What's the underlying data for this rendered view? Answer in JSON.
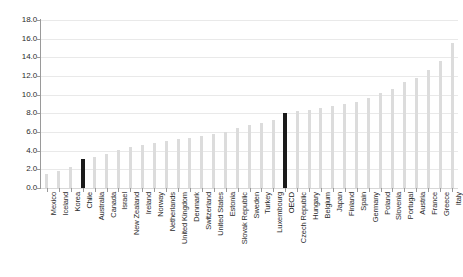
{
  "chart_data": {
    "type": "bar",
    "title": "",
    "subtitle": "",
    "xlabel": "",
    "ylabel": "",
    "ylim": [
      0.0,
      18.0
    ],
    "ytick_labels": [
      "18.0",
      "16.0",
      "14.0",
      "12.0",
      "10.0",
      "8.0",
      "6.0",
      "4.0",
      "2.0",
      "0.0"
    ],
    "ytick_values": [
      18.0,
      16.0,
      14.0,
      12.0,
      10.0,
      8.0,
      6.0,
      4.0,
      2.0,
      0.0
    ],
    "grid": true,
    "legend": "none",
    "bar_color": "#dcdcdc",
    "highlight_color": "#1b1b1b",
    "highlighted": [
      "Chile",
      "OECD"
    ],
    "categories": [
      "Mexico",
      "Iceland",
      "Korea",
      "Chile",
      "Australia",
      "Canada",
      "Israel",
      "New Zealand",
      "Ireland",
      "Norway",
      "Netherlands",
      "United Kingdom",
      "Denmark",
      "Switzerland",
      "United States",
      "Estonia",
      "Slovak Republic",
      "Sweden",
      "Turkey",
      "Luxembourg",
      "OECD",
      "Czech Republic",
      "Hungary",
      "Belgium",
      "Japan",
      "Finland",
      "Spain",
      "Germany",
      "Poland",
      "Slovenia",
      "Portugal",
      "Austria",
      "France",
      "Greece",
      "Italy"
    ],
    "values": [
      1.5,
      1.8,
      2.2,
      3.1,
      3.3,
      3.6,
      4.1,
      4.4,
      4.6,
      4.8,
      5.0,
      5.2,
      5.4,
      5.6,
      5.8,
      6.0,
      6.4,
      6.7,
      7.0,
      7.3,
      8.0,
      8.2,
      8.4,
      8.6,
      8.8,
      9.0,
      9.2,
      9.6,
      10.2,
      10.6,
      11.4,
      11.8,
      12.6,
      13.6,
      15.5
    ]
  }
}
